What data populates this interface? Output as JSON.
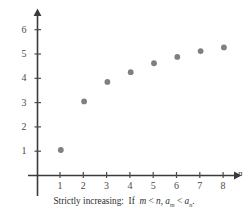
{
  "chart_data": {
    "type": "scatter",
    "title": "",
    "caption": "Strictly increasing: If m < n, a_m < a_n.",
    "xlabel": "n",
    "ylabel": "",
    "x": [
      1,
      2,
      3,
      4,
      5,
      6,
      7,
      8
    ],
    "values": [
      1.05,
      3.05,
      3.85,
      4.25,
      4.62,
      4.88,
      5.12,
      5.27
    ],
    "xticks": [
      1,
      2,
      3,
      4,
      5,
      6,
      7,
      8
    ],
    "yticks": [
      1,
      2,
      3,
      4,
      5,
      6
    ],
    "xlim": [
      0,
      8.6
    ],
    "ylim": [
      0,
      6.8
    ],
    "grid": false,
    "legend": null,
    "point_color": "#808080",
    "axis_color": "#3a3a3a",
    "tick_color": "#4a4a4a",
    "background": "#ffffff",
    "x_axis_arrow": true,
    "y_axis_arrow": true
  },
  "caption": {
    "lead": "Strictly increasing:",
    "if_word": "If",
    "m": "m",
    "lt1": "<",
    "n": "n,",
    "a1": "a",
    "sub1": "m",
    "lt2": "<",
    "a2": "a",
    "sub2": "n",
    "period": "."
  },
  "axis": {
    "x_name": "n"
  }
}
